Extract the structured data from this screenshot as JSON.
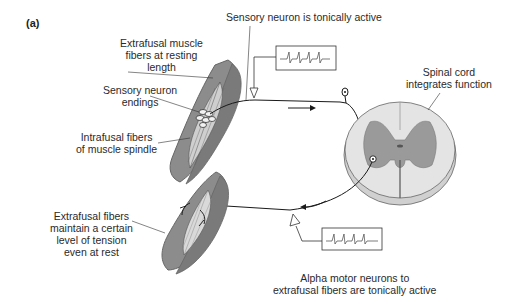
{
  "figure": {
    "panel_label": "(a)",
    "labels": {
      "sensory_active": "Sensory neuron is tonically active",
      "extrafusal_resting_1": "Extrafusal muscle",
      "extrafusal_resting_2": "fibers at resting",
      "extrafusal_resting_3": "length",
      "sensory_endings_1": "Sensory neuron",
      "sensory_endings_2": "endings",
      "intrafusal_1": "Intrafusal fibers",
      "intrafusal_2": "of muscle spindle",
      "spinal_cord_1": "Spinal cord",
      "spinal_cord_2": "integrates function",
      "tension_1": "Extrafusal fibers",
      "tension_2": "maintain a certain",
      "tension_3": "level of tension",
      "tension_4": "even at rest",
      "alpha_1": "Alpha motor neurons to",
      "alpha_2": "extrafusal fibers are tonically active"
    },
    "colors": {
      "muscle": "#8f8f8f",
      "muscle_dark": "#6f6f6f",
      "spindle": "#d9d9d9",
      "cord_white": "#e2e2e2",
      "cord_gray": "#9a9a9a",
      "line": "#1a1a1a"
    }
  }
}
